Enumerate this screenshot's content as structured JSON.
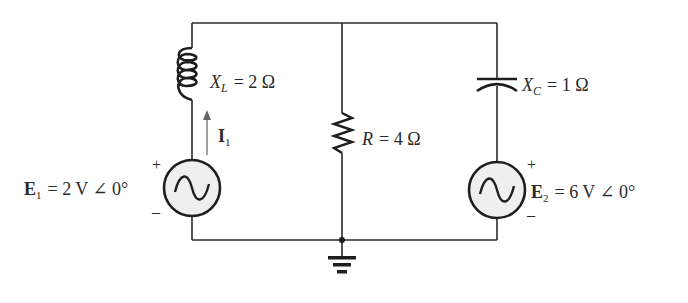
{
  "diagram": {
    "type": "ac-circuit",
    "components": {
      "inductor": {
        "symbol": "X",
        "subscript": "L",
        "value": "= 2 Ω"
      },
      "capacitor": {
        "symbol": "X",
        "subscript": "C",
        "value": "= 1 Ω"
      },
      "resistor": {
        "symbol": "R",
        "value": "= 4 Ω"
      },
      "source1": {
        "symbol": "E",
        "subscript": "1",
        "value": "= 2 V ∠ 0°",
        "plus": "+",
        "minus": "–"
      },
      "source2": {
        "symbol": "E",
        "subscript": "2",
        "value": "= 6 V ∠ 0°",
        "plus": "+",
        "minus": "–"
      },
      "current": {
        "symbol": "I",
        "subscript": "1"
      }
    },
    "colors": {
      "wire": "#2b2b2b",
      "source_fill": "#efefef",
      "arrow": "#777777"
    }
  }
}
